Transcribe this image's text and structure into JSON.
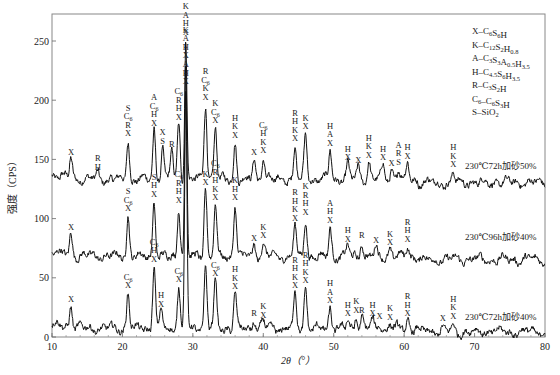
{
  "chart_data": {
    "type": "line",
    "title": "",
    "xlabel": "2θ（°）",
    "ylabel": "强度（CPS）",
    "xlim": [
      10,
      80
    ],
    "ylim": [
      0,
      270
    ],
    "xticks": [
      10,
      20,
      30,
      40,
      50,
      60,
      70,
      80
    ],
    "yticks": [
      0,
      50,
      100,
      150,
      200,
      250
    ],
    "grid": false,
    "legend_position": "top-right",
    "legend": [
      {
        "code": "X",
        "phase": "C6S6H"
      },
      {
        "code": "K",
        "phase": "C12S2H0.8"
      },
      {
        "code": "A",
        "phase": "C3S3A0.5H3.5"
      },
      {
        "code": "H",
        "phase": "C4.5S6H3.5"
      },
      {
        "code": "R",
        "phase": "C3S2H"
      },
      {
        "code": "C6",
        "phase": "C6S3H"
      },
      {
        "code": "S",
        "phase": "SiO2"
      }
    ],
    "series": [
      {
        "name": "230℃72h加砂50%",
        "baseline": 133,
        "label_at": [
          67.5,
          142
        ],
        "peaks": [
          {
            "x": 12.7,
            "y": 150,
            "tag": "X"
          },
          {
            "x": 16.5,
            "y": 138,
            "tag": "R H"
          },
          {
            "x": 20.8,
            "y": 166,
            "tag": "S C6 R X"
          },
          {
            "x": 24.5,
            "y": 175,
            "tag": "A C6 H X"
          },
          {
            "x": 25.7,
            "y": 160,
            "tag": "X S"
          },
          {
            "x": 27.0,
            "y": 157,
            "tag": "R"
          },
          {
            "x": 28.0,
            "y": 180,
            "tag": "C6 R H X"
          },
          {
            "x": 29.0,
            "y": 252,
            "tag": "K A H X"
          },
          {
            "x": 31.8,
            "y": 197,
            "tag": "R C6 K X"
          },
          {
            "x": 33.2,
            "y": 177,
            "tag": "K C6 X"
          },
          {
            "x": 36.0,
            "y": 165,
            "tag": "H K X"
          },
          {
            "x": 38.7,
            "y": 150,
            "tag": "X"
          },
          {
            "x": 40.0,
            "y": 152,
            "tag": "C6 H K X"
          },
          {
            "x": 44.5,
            "y": 162,
            "tag": "R H K X"
          },
          {
            "x": 46.0,
            "y": 172,
            "tag": "K X"
          },
          {
            "x": 49.5,
            "y": 158,
            "tag": "H A X"
          },
          {
            "x": 52.0,
            "y": 146,
            "tag": "H X"
          },
          {
            "x": 53.5,
            "y": 144,
            "tag": "X"
          },
          {
            "x": 55.0,
            "y": 148,
            "tag": "H K X"
          },
          {
            "x": 57.0,
            "y": 146,
            "tag": "H X"
          },
          {
            "x": 58.2,
            "y": 141,
            "tag": "X"
          },
          {
            "x": 59.2,
            "y": 142,
            "tag": "A R S"
          },
          {
            "x": 60.5,
            "y": 147,
            "tag": "H X"
          },
          {
            "x": 67.0,
            "y": 140,
            "tag": "H K X"
          }
        ]
      },
      {
        "name": "230℃96h加砂40%",
        "baseline": 68,
        "label_at": [
          67.5,
          82
        ],
        "peaks": [
          {
            "x": 12.7,
            "y": 87,
            "tag": "X"
          },
          {
            "x": 20.8,
            "y": 103,
            "tag": "S C6 X"
          },
          {
            "x": 24.5,
            "y": 115,
            "tag": "S H X"
          },
          {
            "x": 28.0,
            "y": 110,
            "tag": "C6 R H X"
          },
          {
            "x": 29.0,
            "y": 232,
            "tag": "K A H X"
          },
          {
            "x": 31.8,
            "y": 125,
            "tag": "K X"
          },
          {
            "x": 33.2,
            "y": 112,
            "tag": "C6 R H K X"
          },
          {
            "x": 36.0,
            "y": 112,
            "tag": "K H X"
          },
          {
            "x": 38.7,
            "y": 78,
            "tag": "X"
          },
          {
            "x": 40.0,
            "y": 80,
            "tag": "K X"
          },
          {
            "x": 44.5,
            "y": 95,
            "tag": "R H K X"
          },
          {
            "x": 46.0,
            "y": 100,
            "tag": "K R H X"
          },
          {
            "x": 49.5,
            "y": 93,
            "tag": "A H X"
          },
          {
            "x": 52.0,
            "y": 77,
            "tag": "H X"
          },
          {
            "x": 54.0,
            "y": 80,
            "tag": "R"
          },
          {
            "x": 56.0,
            "y": 76,
            "tag": "X"
          },
          {
            "x": 58.0,
            "y": 74,
            "tag": "K X"
          },
          {
            "x": 60.5,
            "y": 77,
            "tag": "R H X"
          }
        ]
      },
      {
        "name": "230℃72h加砂40%",
        "baseline": 7,
        "label_at": [
          67.5,
          14
        ],
        "peaks": [
          {
            "x": 12.7,
            "y": 26,
            "tag": "X"
          },
          {
            "x": 20.8,
            "y": 38,
            "tag": "C6 X"
          },
          {
            "x": 24.5,
            "y": 60,
            "tag": "C6 H X"
          },
          {
            "x": 25.5,
            "y": 22,
            "tag": "H X"
          },
          {
            "x": 28.0,
            "y": 43,
            "tag": "C6 X"
          },
          {
            "x": 29.0,
            "y": 210,
            "tag": "A H X"
          },
          {
            "x": 31.8,
            "y": 60,
            "tag": ""
          },
          {
            "x": 33.2,
            "y": 48,
            "tag": "C6 X"
          },
          {
            "x": 36.0,
            "y": 37,
            "tag": "H K X"
          },
          {
            "x": 38.7,
            "y": 14,
            "tag": "R"
          },
          {
            "x": 40.0,
            "y": 13,
            "tag": "K X"
          },
          {
            "x": 44.5,
            "y": 38,
            "tag": "R H K X"
          },
          {
            "x": 46.0,
            "y": 42,
            "tag": "R H K X"
          },
          {
            "x": 49.5,
            "y": 25,
            "tag": "H A X"
          },
          {
            "x": 52.0,
            "y": 14,
            "tag": "H X"
          },
          {
            "x": 53.2,
            "y": 17,
            "tag": "K X"
          },
          {
            "x": 54.0,
            "y": 17,
            "tag": "R"
          },
          {
            "x": 55.5,
            "y": 14,
            "tag": "H X"
          },
          {
            "x": 56.5,
            "y": 12,
            "tag": "X"
          },
          {
            "x": 58.0,
            "y": 11,
            "tag": "K X"
          },
          {
            "x": 60.5,
            "y": 14,
            "tag": "R H X"
          },
          {
            "x": 65.5,
            "y": 10,
            "tag": "X"
          },
          {
            "x": 67.0,
            "y": 12,
            "tag": "H K X"
          }
        ]
      }
    ]
  }
}
